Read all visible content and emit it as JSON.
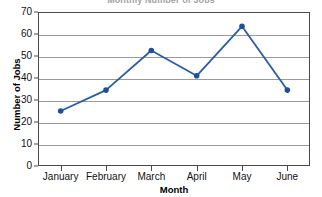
{
  "chart_data": {
    "type": "line",
    "title": "Monthly Number of Jobs",
    "xlabel": "Month",
    "ylabel": "Number of Jobs",
    "categories": [
      "January",
      "February",
      "March",
      "April",
      "May",
      "June"
    ],
    "values": [
      25,
      34.5,
      52.5,
      41,
      63.5,
      34.5
    ],
    "series": [
      {
        "name": "Number of Jobs",
        "values": [
          25,
          34.5,
          52.5,
          41,
          63.5,
          34.5
        ]
      }
    ],
    "ylim": [
      0,
      70
    ],
    "y_ticks": [
      0,
      10,
      20,
      30,
      40,
      50,
      60,
      70
    ],
    "y_tick_labels": [
      "0",
      "10",
      "20",
      "30",
      "40",
      "50",
      "60",
      "70"
    ],
    "grid": "horizontal",
    "legend": "none",
    "marker": "circle",
    "line_color": "#2a5ca8",
    "marker_color": "#1f4e9c",
    "grid_color": "#9a9a9a",
    "frame_color": "#4a4a4a",
    "background": "#ffffff"
  }
}
